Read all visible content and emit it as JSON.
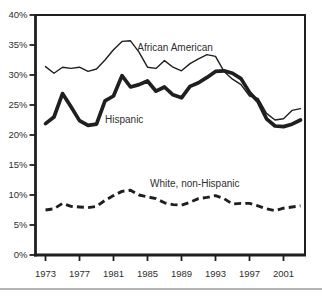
{
  "page": {
    "background_color": "#ffffff",
    "separator_color": "#b4b4b4"
  },
  "chart_data": {
    "type": "line",
    "title": "",
    "xlabel": "",
    "ylabel": "",
    "x": [
      1973,
      1974,
      1975,
      1976,
      1977,
      1978,
      1979,
      1980,
      1981,
      1982,
      1983,
      1984,
      1985,
      1986,
      1987,
      1988,
      1989,
      1990,
      1991,
      1992,
      1993,
      1994,
      1995,
      1996,
      1997,
      1998,
      1999,
      2000,
      2001,
      2002,
      2003
    ],
    "series": [
      {
        "name": "African American",
        "style": "thin-solid",
        "values": [
          31.4,
          30.3,
          31.3,
          31.1,
          31.3,
          30.6,
          31.0,
          32.5,
          34.2,
          35.6,
          35.7,
          33.8,
          31.3,
          31.1,
          32.4,
          31.3,
          30.7,
          31.9,
          32.7,
          33.4,
          33.1,
          30.6,
          29.3,
          28.4,
          26.5,
          26.1,
          23.6,
          22.5,
          22.7,
          24.1,
          24.4
        ]
      },
      {
        "name": "Hispanic",
        "style": "thick-solid",
        "values": [
          21.9,
          23.0,
          26.9,
          24.7,
          22.4,
          21.6,
          21.8,
          25.7,
          26.5,
          29.9,
          28.0,
          28.4,
          29.0,
          27.3,
          28.0,
          26.7,
          26.2,
          28.1,
          28.7,
          29.6,
          30.6,
          30.7,
          30.3,
          29.4,
          27.1,
          25.6,
          22.7,
          21.5,
          21.4,
          21.8,
          22.5
        ]
      },
      {
        "name": "White, non-Hispanic",
        "style": "thick-dashed",
        "values": [
          7.5,
          7.7,
          8.6,
          8.1,
          8.0,
          7.9,
          8.1,
          9.1,
          9.9,
          10.6,
          10.8,
          10.0,
          9.7,
          9.4,
          8.7,
          8.4,
          8.3,
          8.8,
          9.4,
          9.6,
          9.9,
          9.4,
          8.5,
          8.6,
          8.6,
          8.2,
          7.7,
          7.4,
          7.8,
          8.0,
          8.2
        ]
      }
    ],
    "annotations": [
      {
        "label": "African American",
        "year": 1983.8,
        "value": 34.0
      },
      {
        "label": "Hispanic",
        "year": 1980.0,
        "value": 22.0
      },
      {
        "label": "White, non-Hispanic",
        "year": 1985.3,
        "value": 11.3
      }
    ],
    "ylim": [
      0,
      40
    ],
    "ytick_step": 5,
    "ytick_labels": [
      "0%",
      "5%",
      "10%",
      "15%",
      "20%",
      "25%",
      "30%",
      "35%",
      "40%"
    ],
    "xticks": [
      1973,
      1977,
      1981,
      1985,
      1989,
      1993,
      1997,
      2001
    ],
    "xtick_labels": [
      "1973",
      "1977",
      "1981",
      "1985",
      "1989",
      "1993",
      "1997",
      "2001"
    ],
    "grid": false,
    "legend_position": "inline-annotations",
    "line_color": "#1f1f1f",
    "text_color": "#2f2f2f"
  }
}
